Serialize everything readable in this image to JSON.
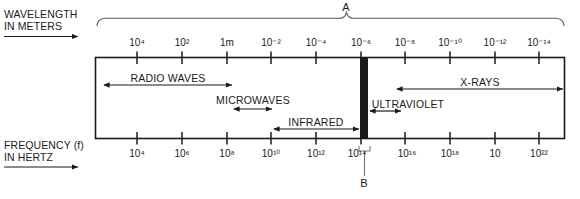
{
  "figure": {
    "type": "electromagnetic-spectrum-diagram",
    "width": 580,
    "height": 199,
    "background": "#ffffff",
    "ink": "#1a1a1a"
  },
  "axes": {
    "wavelength": {
      "caption_line1": "WAVELENGTH",
      "caption_line2": "IN METERS",
      "direction_arrow": "right",
      "tick_labels": [
        {
          "mantissa": "10",
          "exponent": "4",
          "text": "10⁴"
        },
        {
          "mantissa": "10",
          "exponent": "2",
          "text": "10²"
        },
        {
          "mantissa": "1m",
          "exponent": "",
          "text": "1m"
        },
        {
          "mantissa": "10",
          "exponent": "-2",
          "text": "10⁻²"
        },
        {
          "mantissa": "10",
          "exponent": "-4",
          "text": "10⁻⁴"
        },
        {
          "mantissa": "10",
          "exponent": "-6",
          "text": "10⁻⁶"
        },
        {
          "mantissa": "10",
          "exponent": "-8",
          "text": "10⁻⁸"
        },
        {
          "mantissa": "10",
          "exponent": "-10",
          "text": "10⁻¹⁰"
        },
        {
          "mantissa": "10",
          "exponent": "-12",
          "text": "10⁻¹²"
        },
        {
          "mantissa": "10",
          "exponent": "-14",
          "text": "10⁻¹⁴"
        }
      ]
    },
    "frequency": {
      "caption_line1": "FREQUENCY (f)",
      "caption_line2": "IN HERTZ",
      "direction_arrow": "right",
      "tick_labels": [
        {
          "mantissa": "10",
          "exponent": "4",
          "text": "10⁴"
        },
        {
          "mantissa": "10",
          "exponent": "6",
          "text": "10⁶"
        },
        {
          "mantissa": "10",
          "exponent": "8",
          "text": "10⁸"
        },
        {
          "mantissa": "10",
          "exponent": "10",
          "text": "10¹⁰"
        },
        {
          "mantissa": "10",
          "exponent": "12",
          "text": "10¹²"
        },
        {
          "mantissa": "10",
          "exponent": "14",
          "text": "10¹⁴"
        },
        {
          "mantissa": "10",
          "exponent": "16",
          "text": "10¹⁶"
        },
        {
          "mantissa": "10",
          "exponent": "18",
          "text": "10¹⁸"
        },
        {
          "mantissa": "10",
          "exponent": "",
          "text": "10"
        },
        {
          "mantissa": "10",
          "exponent": "22",
          "text": "10²²"
        }
      ]
    }
  },
  "bands": [
    {
      "label": "RADIO WAVES",
      "arrow": "double"
    },
    {
      "label": "MICROWAVES",
      "arrow": "double"
    },
    {
      "label": "INFRARED",
      "arrow": "double"
    },
    {
      "label": "ULTRAVIOLET",
      "arrow": "double"
    },
    {
      "label": "X-RAYS",
      "arrow": "double"
    }
  ],
  "callouts": [
    {
      "id": "A",
      "label": "A",
      "marker": "top-brace",
      "points_to": "entire-spectrum"
    },
    {
      "id": "B",
      "label": "B",
      "marker": "bottom-bracket-leader",
      "points_to": "visible-light-band"
    }
  ],
  "visible_band": {
    "name": "visible-light-bar",
    "fill": "#1a1a1a"
  }
}
